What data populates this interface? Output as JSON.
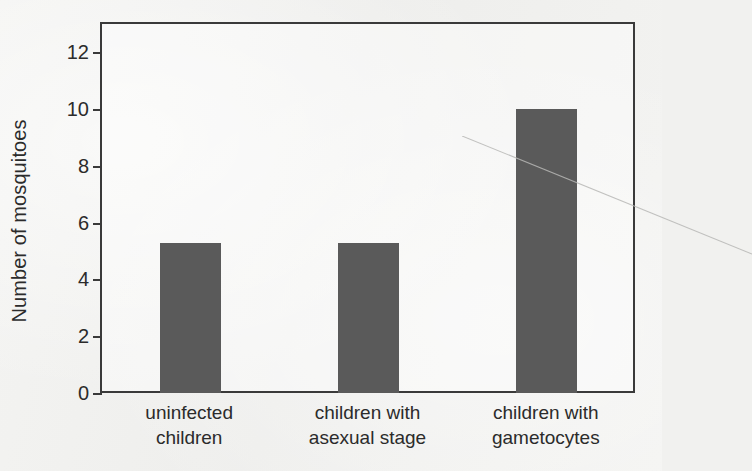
{
  "chart_data": {
    "type": "bar",
    "title": "",
    "subtitle": "",
    "xlabel": "",
    "ylabel": "Number of mosquitoes",
    "categories": [
      "uninfected children",
      "children with asexual stage",
      "children with gametocytes"
    ],
    "category_lines": [
      [
        "uninfected",
        "children"
      ],
      [
        "children with",
        "asexual stage"
      ],
      [
        "children with",
        "gametocytes"
      ]
    ],
    "values": [
      5.3,
      5.3,
      10.0
    ],
    "ylim": [
      0,
      13
    ],
    "yticks": [
      0,
      2,
      4,
      6,
      8,
      10,
      12
    ],
    "ytick_labels": [
      "0",
      "2",
      "4",
      "6",
      "8",
      "10",
      "12"
    ],
    "grid": false,
    "legend": false,
    "legend_position": "none",
    "bar_color": "#5a5a5a",
    "axis_color": "#3a3a3a",
    "background_color": "#f1f1ef",
    "annotations": []
  },
  "figure": {
    "y_axis_title": "Number of mosquitoes"
  }
}
